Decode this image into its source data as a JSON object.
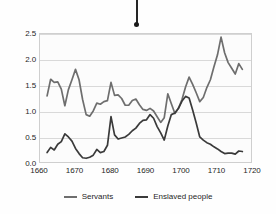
{
  "figure": {
    "background_color": "#fefefe",
    "plot_background_color": "#fcfcfc",
    "grid_color": "#d9d9d9",
    "frame_color": "#cfcfcf"
  },
  "marker": {
    "name": "pin-marker",
    "description": "vertical pin with round dot at its base above the chart"
  },
  "chart_data": {
    "type": "line",
    "title": "",
    "subtitle": "",
    "xlabel": "",
    "ylabel": "",
    "xlim": [
      1660,
      1720
    ],
    "ylim": [
      0.0,
      2.5
    ],
    "xticks": [
      1660,
      1670,
      1680,
      1690,
      1700,
      1710,
      1720
    ],
    "xticklabels": [
      "1660",
      "1670",
      "1680",
      "1690",
      "1700",
      "1710",
      "1720"
    ],
    "yticks": [
      0.0,
      0.5,
      1.0,
      1.5,
      2.0,
      2.5
    ],
    "yticklabels": [
      "0.0",
      "0.5",
      "1.0",
      "1.5",
      "2.0",
      "2.5"
    ],
    "grid": true,
    "grid_axis": "y",
    "legend_position": "bottom-center",
    "line_colors": {
      "servants": "#6e6e6e",
      "enslaved_people": "#3a3a3a"
    },
    "series": [
      {
        "name": "Servants",
        "color": "#6e6e6e",
        "x": [
          1662,
          1663,
          1664,
          1665,
          1666,
          1667,
          1668,
          1669,
          1670,
          1671,
          1672,
          1673,
          1674,
          1675,
          1676,
          1677,
          1678,
          1679,
          1680,
          1681,
          1682,
          1683,
          1684,
          1685,
          1686,
          1687,
          1688,
          1689,
          1690,
          1691,
          1692,
          1693,
          1694,
          1695,
          1696,
          1697,
          1698,
          1699,
          1700,
          1701,
          1702,
          1703,
          1704,
          1705,
          1706,
          1707,
          1708,
          1709,
          1710,
          1711,
          1712,
          1713,
          1714,
          1715,
          1716,
          1717
        ],
        "values": [
          1.31,
          1.63,
          1.57,
          1.58,
          1.44,
          1.12,
          1.43,
          1.62,
          1.82,
          1.62,
          1.24,
          0.95,
          0.92,
          1.02,
          1.17,
          1.15,
          1.2,
          1.22,
          1.57,
          1.32,
          1.33,
          1.26,
          1.13,
          1.13,
          1.22,
          1.25,
          1.14,
          1.05,
          1.03,
          1.07,
          1.02,
          0.91,
          0.8,
          0.89,
          1.35,
          1.16,
          0.97,
          1.07,
          1.24,
          1.48,
          1.67,
          1.53,
          1.37,
          1.2,
          1.28,
          1.47,
          1.62,
          1.87,
          2.1,
          2.44,
          2.14,
          1.95,
          1.84,
          1.73,
          1.93,
          1.82
        ]
      },
      {
        "name": "Enslaved people",
        "color": "#3a3a3a",
        "x": [
          1662,
          1663,
          1664,
          1665,
          1666,
          1667,
          1668,
          1669,
          1670,
          1671,
          1672,
          1673,
          1674,
          1675,
          1676,
          1677,
          1678,
          1679,
          1680,
          1681,
          1682,
          1683,
          1684,
          1685,
          1686,
          1687,
          1688,
          1689,
          1690,
          1691,
          1692,
          1693,
          1694,
          1695,
          1696,
          1697,
          1698,
          1699,
          1700,
          1701,
          1702,
          1703,
          1704,
          1705,
          1706,
          1707,
          1708,
          1709,
          1710,
          1711,
          1712,
          1713,
          1714,
          1715,
          1716,
          1717
        ],
        "values": [
          0.22,
          0.32,
          0.27,
          0.38,
          0.43,
          0.58,
          0.52,
          0.44,
          0.3,
          0.2,
          0.12,
          0.11,
          0.13,
          0.17,
          0.28,
          0.22,
          0.24,
          0.36,
          0.91,
          0.56,
          0.48,
          0.5,
          0.52,
          0.57,
          0.64,
          0.69,
          0.78,
          0.84,
          0.85,
          0.95,
          0.88,
          0.72,
          0.6,
          0.46,
          0.73,
          0.95,
          0.98,
          1.07,
          1.21,
          1.3,
          1.27,
          1.04,
          0.79,
          0.52,
          0.46,
          0.41,
          0.38,
          0.33,
          0.29,
          0.24,
          0.2,
          0.21,
          0.21,
          0.19,
          0.25,
          0.24
        ]
      }
    ]
  },
  "legend": {
    "entries": [
      {
        "label": "Servants",
        "color": "#6e6e6e"
      },
      {
        "label": "Enslaved people",
        "color": "#3a3a3a"
      }
    ]
  }
}
